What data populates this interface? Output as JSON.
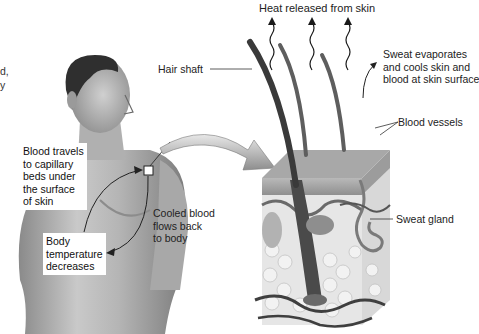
{
  "figure": {
    "title": "Heat released from skin",
    "left_cut_text": [
      "d,",
      "y"
    ],
    "labels": {
      "hair_shaft": "Hair shaft",
      "sweat_evaporates": [
        "Sweat evaporates",
        "and cools skin and",
        "blood at skin surface"
      ],
      "blood_vessels": "Blood vessels",
      "sweat_gland": "Sweat gland",
      "cooled_blood": [
        "Cooled blood",
        "flows back",
        "to body"
      ],
      "blood_travels": [
        "Blood travels",
        "to capillary",
        "beds under",
        "the surface",
        "of skin"
      ],
      "body_temperature": [
        "Body",
        "temperature",
        "decreases"
      ]
    },
    "colors": {
      "background": "#ffffff",
      "line": "#333333",
      "skin_shade": "#9a9a9a",
      "fat": "#e2e2e2",
      "vessel": "#4a4a4a"
    }
  }
}
